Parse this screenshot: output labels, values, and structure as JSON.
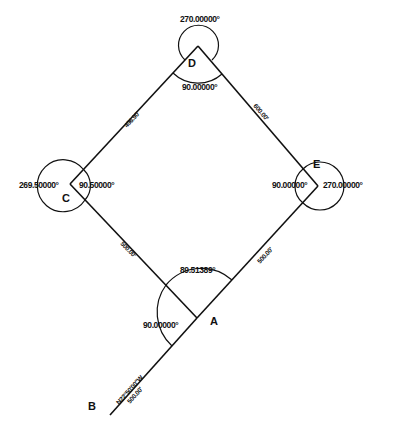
{
  "diagram": {
    "type": "survey-traverse",
    "points": {
      "A": {
        "label": "A",
        "x": 197,
        "y": 318
      },
      "B": {
        "label": "B",
        "x": 110,
        "y": 415
      },
      "C": {
        "label": "C",
        "x": 70,
        "y": 184
      },
      "D": {
        "label": "D",
        "x": 198,
        "y": 46
      },
      "E": {
        "label": "E",
        "x": 318,
        "y": 186
      }
    },
    "angles": {
      "D_exterior": "270.00000°",
      "D_interior": "90.00000°",
      "C_exterior": "269.50000°",
      "C_interior": "90.50000°",
      "E_interior": "90.00000°",
      "E_exterior": "270.00000°",
      "A_interior": "89.51389°",
      "A_to_B": "90.00000°"
    },
    "distances": {
      "CD": "496.90'",
      "DE": "600.00'",
      "CA": "500.00'",
      "AE": "500.00'",
      "AB_bearing": "N22°50'00\"W",
      "AB": "500.00'"
    }
  }
}
